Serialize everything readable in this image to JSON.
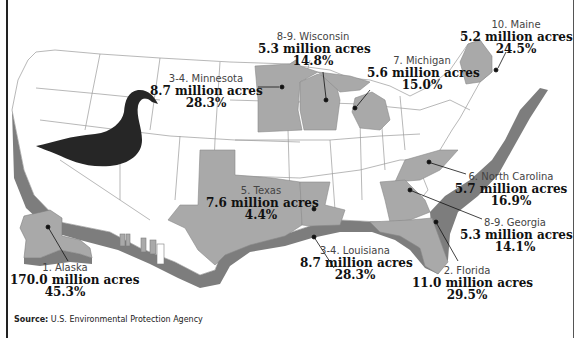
{
  "colors": {
    "highlight_state": "#a9a9a9",
    "coastal_band": "#7d7d7d",
    "state_fill": "#ffffff",
    "state_border": "#9a9a9a",
    "swan": "#262626",
    "text": "#111111"
  },
  "states": [
    {
      "rank": "1. Alaska",
      "acres": "170.0 million acres",
      "pct": "45.3%"
    },
    {
      "rank": "2. Florida",
      "acres": "11.0 million acres",
      "pct": "29.5%"
    },
    {
      "rank": "3-4. Louisiana",
      "acres": "8.7 million acres",
      "pct": "28.3%"
    },
    {
      "rank": "3-4. Minnesota",
      "acres": "8.7 million acres",
      "pct": "28.3%"
    },
    {
      "rank": "5. Texas",
      "acres": "7.6 million acres",
      "pct": "4.4%"
    },
    {
      "rank": "6. North Carolina",
      "acres": "5.7 million acres",
      "pct": "16.9%"
    },
    {
      "rank": "7. Michigan",
      "acres": "5.6 million acres",
      "pct": "15.0%"
    },
    {
      "rank": "8-9. Georgia",
      "acres": "5.3 million acres",
      "pct": "14.1%"
    },
    {
      "rank": "8-9. Wisconsin",
      "acres": "5.3 million acres",
      "pct": "14.8%"
    },
    {
      "rank": "10. Maine",
      "acres": "5.2 million acres",
      "pct": "24.5%"
    }
  ],
  "source": {
    "label": "Source:",
    "text": "U.S. Environmental Protection Agency"
  }
}
